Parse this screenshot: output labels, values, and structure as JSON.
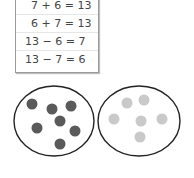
{
  "fact_family": {
    "facts": [
      "7 + 6 = 13",
      "6 + 7 = 13",
      "13 − 6 = 7",
      "13 − 7 = 6"
    ]
  },
  "sets": {
    "left": {
      "count": 7,
      "dot_color": "#5a5a5a"
    },
    "right": {
      "count": 6,
      "dot_color": "#c9c9c9"
    },
    "outline_color": "#222222"
  }
}
